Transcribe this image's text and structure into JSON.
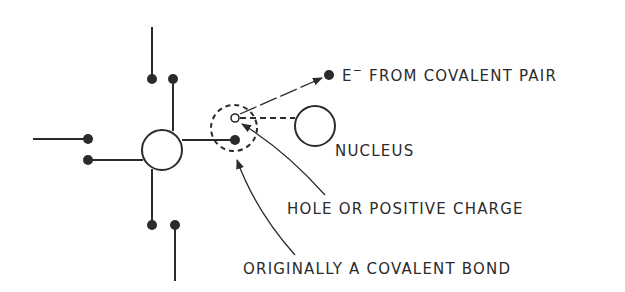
{
  "diagram": {
    "labels": {
      "electron": "E",
      "electron_sup": "−",
      "electron_rest": " FROM COVALENT PAIR",
      "nucleus": "NUCLEUS",
      "hole": "HOLE OR POSITIVE CHARGE",
      "bond": "ORIGINALLY A COVALENT BOND"
    },
    "colors": {
      "ink": "#2b2b2b",
      "background": "#ffffff"
    }
  }
}
